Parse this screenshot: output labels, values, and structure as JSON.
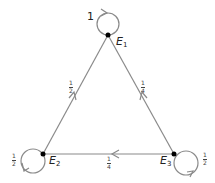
{
  "diagram": {
    "type": "markov-chain-state-diagram",
    "states": [
      {
        "id": "E1",
        "name": "E",
        "subscript": "1"
      },
      {
        "id": "E2",
        "name": "E",
        "subscript": "2"
      },
      {
        "id": "E3",
        "name": "E",
        "subscript": "3"
      }
    ],
    "transitions": [
      {
        "from": "E1",
        "to": "E1",
        "label": "1",
        "num": "1",
        "den": ""
      },
      {
        "from": "E2",
        "to": "E1",
        "label": "1/2",
        "num": "1",
        "den": "2"
      },
      {
        "from": "E2",
        "to": "E2",
        "label": "1/2",
        "num": "1",
        "den": "2"
      },
      {
        "from": "E3",
        "to": "E1",
        "label": "1/4",
        "num": "1",
        "den": "4"
      },
      {
        "from": "E3",
        "to": "E2",
        "label": "1/4",
        "num": "1",
        "den": "4"
      },
      {
        "from": "E3",
        "to": "E3",
        "label": "1/2",
        "num": "1",
        "den": "2"
      }
    ],
    "colors": {
      "edge": "#8a8a8a",
      "node": "#000000",
      "text": "#222222"
    }
  }
}
